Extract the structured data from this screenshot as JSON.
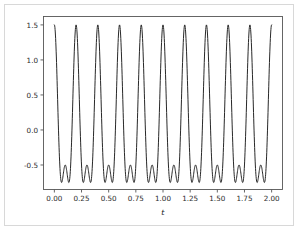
{
  "figure": {
    "background_color": "#ffffff",
    "border_color": "#d8d8d8",
    "line_color": "#1c1c1c",
    "axis_color": "#555555",
    "text_color": "#2b2b2b"
  },
  "chart_data": {
    "type": "line",
    "title": "",
    "xlabel": "t",
    "ylabel": "",
    "xlim": [
      -0.1,
      2.1
    ],
    "ylim": [
      -0.85,
      1.62
    ],
    "xticks": [
      0.0,
      0.25,
      0.5,
      0.75,
      1.0,
      1.25,
      1.5,
      1.75,
      2.0
    ],
    "xtick_labels": [
      "0.00",
      "0.25",
      "0.50",
      "0.75",
      "1.00",
      "1.25",
      "1.50",
      "1.75",
      "2.00"
    ],
    "yticks": [
      -0.5,
      0.0,
      0.5,
      1.0,
      1.5
    ],
    "ytick_labels": [
      "-0.5",
      "0.0",
      "0.5",
      "1.0",
      "1.5"
    ],
    "grid": false,
    "legend": false,
    "legend_position": "none",
    "series": [
      {
        "name": "signal",
        "color": "#1c1c1c",
        "linewidth": 0.95,
        "formula": "cos(2*pi*5*t) + 0.5*cos(2*pi*10*t)",
        "period": 0.2,
        "fundamental_frequency_hz": 5,
        "harmonic_frequency_hz": 10,
        "amplitudes": [
          1.0,
          0.5
        ],
        "x_start": 0.0,
        "x_end": 2.0,
        "n_samples": 1200,
        "peak_value": 1.5,
        "trough_min_value": -0.72,
        "trough_mid_value": -0.52,
        "peak_times": [
          0.0,
          0.2,
          0.4,
          0.6,
          0.8,
          1.0,
          1.2,
          1.4,
          1.6,
          1.8,
          2.0
        ],
        "n_visible_peaks": 11
      }
    ]
  }
}
